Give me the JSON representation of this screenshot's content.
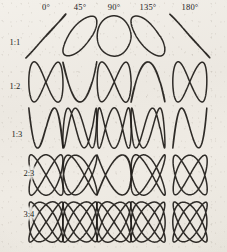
{
  "figure": {
    "background_color": "#efece6",
    "ink_color": "#1d1a17",
    "width": 227,
    "height": 252
  },
  "grid": {
    "column_headers": [
      "0°",
      "45°",
      "90°",
      "135°",
      "180°"
    ],
    "row_headers": [
      "1:1",
      "1:2",
      "1:3",
      "2:3",
      "3:4"
    ],
    "columns": 5,
    "rows": 5
  },
  "chart_data": {
    "type": "line",
    "xlabel": "Phase difference",
    "ylabel": "Frequency ratio",
    "grid": false,
    "legend": "none",
    "param_form": "x = A*sin(a*t + delta), y = B*sin(b*t)",
    "phases_deg": [
      0,
      45,
      90,
      135,
      180
    ],
    "ratios": [
      "1:1",
      "1:2",
      "1:3",
      "2:3",
      "3:4"
    ],
    "cells": [
      {
        "ratio": "1:1",
        "a": 1,
        "b": 1,
        "phase_deg": 0,
        "shape": "diagonal line, rising left-to-right"
      },
      {
        "ratio": "1:1",
        "a": 1,
        "b": 1,
        "phase_deg": 45,
        "shape": "tilted narrow ellipse"
      },
      {
        "ratio": "1:1",
        "a": 1,
        "b": 1,
        "phase_deg": 90,
        "shape": "circle"
      },
      {
        "ratio": "1:1",
        "a": 1,
        "b": 1,
        "phase_deg": 135,
        "shape": "tilted narrow ellipse, opposite lean"
      },
      {
        "ratio": "1:1",
        "a": 1,
        "b": 1,
        "phase_deg": 180,
        "shape": "diagonal line, falling left-to-right"
      },
      {
        "ratio": "1:2",
        "a": 1,
        "b": 2,
        "phase_deg": 0,
        "shape": "open parabola-like arc"
      },
      {
        "ratio": "1:2",
        "a": 1,
        "b": 2,
        "phase_deg": 45,
        "shape": "single-crossing loop"
      },
      {
        "ratio": "1:2",
        "a": 1,
        "b": 2,
        "phase_deg": 90,
        "shape": "figure eight"
      },
      {
        "ratio": "1:2",
        "a": 1,
        "b": 2,
        "phase_deg": 135,
        "shape": "single-crossing loop, mirrored"
      },
      {
        "ratio": "1:2",
        "a": 1,
        "b": 2,
        "phase_deg": 180,
        "shape": "open arc, mirrored"
      },
      {
        "ratio": "1:3",
        "a": 1,
        "b": 3,
        "phase_deg": 0,
        "shape": "open S curve"
      },
      {
        "ratio": "1:3",
        "a": 1,
        "b": 3,
        "phase_deg": 45,
        "shape": "two-crossing zigzag"
      },
      {
        "ratio": "1:3",
        "a": 1,
        "b": 3,
        "phase_deg": 90,
        "shape": "triple loop zigzag"
      },
      {
        "ratio": "1:3",
        "a": 1,
        "b": 3,
        "phase_deg": 135,
        "shape": "two-crossing zigzag, mirrored"
      },
      {
        "ratio": "1:3",
        "a": 1,
        "b": 3,
        "phase_deg": 180,
        "shape": "open S curve, mirrored"
      },
      {
        "ratio": "2:3",
        "a": 2,
        "b": 3,
        "phase_deg": 0,
        "shape": "open crossed curve"
      },
      {
        "ratio": "2:3",
        "a": 2,
        "b": 3,
        "phase_deg": 45,
        "shape": "woven lattice"
      },
      {
        "ratio": "2:3",
        "a": 2,
        "b": 3,
        "phase_deg": 90,
        "shape": "symmetric woven knot"
      },
      {
        "ratio": "2:3",
        "a": 2,
        "b": 3,
        "phase_deg": 135,
        "shape": "woven lattice, mirrored"
      },
      {
        "ratio": "2:3",
        "a": 2,
        "b": 3,
        "phase_deg": 180,
        "shape": "open crossed curve, mirrored"
      },
      {
        "ratio": "3:4",
        "a": 3,
        "b": 4,
        "phase_deg": 0,
        "shape": "open double loop"
      },
      {
        "ratio": "3:4",
        "a": 3,
        "b": 4,
        "phase_deg": 45,
        "shape": "dense woven lattice"
      },
      {
        "ratio": "3:4",
        "a": 3,
        "b": 4,
        "phase_deg": 90,
        "shape": "dense symmetric lattice"
      },
      {
        "ratio": "3:4",
        "a": 3,
        "b": 4,
        "phase_deg": 135,
        "shape": "dense woven lattice, mirrored"
      },
      {
        "ratio": "3:4",
        "a": 3,
        "b": 4,
        "phase_deg": 180,
        "shape": "open double loop, mirrored"
      }
    ]
  },
  "layout": {
    "col_centers_x": [
      46,
      80,
      114,
      148,
      190
    ],
    "row_centers_y": [
      36,
      82,
      128,
      175,
      222
    ],
    "cell_half_width": 17,
    "cell_half_height": 20,
    "header_y": 2,
    "row_label_x": [
      8,
      8,
      10,
      22,
      22
    ],
    "row_label_y": [
      36,
      80,
      128,
      167,
      208
    ],
    "row_label_haloed": [
      false,
      false,
      false,
      true,
      true
    ],
    "stroke_width": 1.5
  }
}
